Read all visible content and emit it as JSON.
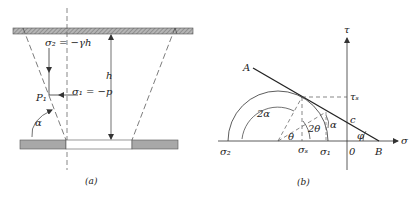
{
  "figure_a": {
    "caption": "(a)",
    "labels": {
      "sigma2_eq": "σ₂ = −γh",
      "sigma1_eq": "σ₁ = −p",
      "point": "P₁",
      "height": "h",
      "angle": "α"
    }
  },
  "figure_b": {
    "caption": "(b)",
    "labels": {
      "tau_axis": "τ",
      "sigma_axis": "σ",
      "point_A": "A",
      "point_B": "B",
      "tau_s": "τₛ",
      "cohesion": "c",
      "origin": "0",
      "friction_angle": "φ",
      "sigma2": "σ₂",
      "sigma1": "σ₁",
      "sigma_s": "σₛ",
      "two_alpha": "2α",
      "two_theta": "2θ",
      "theta": "θ",
      "alpha": "α"
    }
  }
}
